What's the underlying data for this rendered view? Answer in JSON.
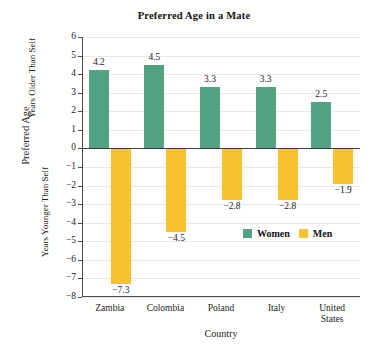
{
  "chart_data": {
    "type": "bar",
    "title": "Preferred Age in a Mate",
    "xlabel": "Country",
    "ylabel": "Preferred Age",
    "ylabel_upper": "Years Older Than Self",
    "ylabel_lower": "Years Younger Than Self",
    "categories": [
      "Zambia",
      "Colombia",
      "Poland",
      "Italy",
      "United States"
    ],
    "category_lines": [
      [
        "Zambia"
      ],
      [
        "Colombia"
      ],
      [
        "Poland"
      ],
      [
        "Italy"
      ],
      [
        "United",
        "States"
      ]
    ],
    "series": [
      {
        "name": "Women",
        "color": "#52a282",
        "values": [
          4.2,
          4.5,
          3.3,
          3.3,
          2.5
        ]
      },
      {
        "name": "Men",
        "color": "#f5c32e",
        "values": [
          -7.3,
          -4.5,
          -2.8,
          -2.8,
          -1.9
        ]
      }
    ],
    "value_labels": {
      "Women": [
        "4.2",
        "4.5",
        "3.3",
        "3.3",
        "2.5"
      ],
      "Men": [
        "−7.3",
        "−4.5",
        "−2.8",
        "−2.8",
        "−1.9"
      ]
    },
    "ylim": [
      -8,
      6
    ],
    "yticks": [
      6,
      5,
      4,
      3,
      2,
      1,
      0,
      -1,
      -2,
      -3,
      -4,
      -5,
      -6,
      -7,
      -8
    ],
    "ytick_labels": [
      "6",
      "5",
      "4",
      "3",
      "2",
      "1",
      "0",
      "−1",
      "−2",
      "−3",
      "−4",
      "−5",
      "−6",
      "−7",
      "−8"
    ],
    "grid": true,
    "legend_position": "inside-right",
    "legend": [
      {
        "label": "Women",
        "color": "#52a282"
      },
      {
        "label": "Men",
        "color": "#f5c32e"
      }
    ]
  }
}
